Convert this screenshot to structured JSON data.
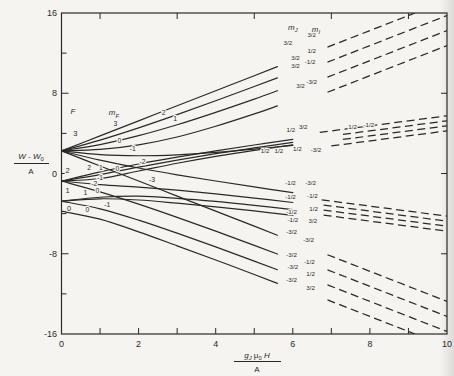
{
  "page": {
    "paper": "#f5f4f0",
    "ink": "#2a2927"
  },
  "chart_data": {
    "type": "line",
    "title": "",
    "x_axis": {
      "min": 0,
      "max": 10,
      "tick_step": 1,
      "labels": [
        0,
        2,
        4,
        6,
        8,
        10
      ],
      "top_ticks": [
        1,
        3,
        5,
        7,
        9
      ],
      "title": {
        "numerator": [
          {
            "t": "g",
            "italic": true
          },
          {
            "t": "J",
            "sub": true,
            "italic": true
          },
          {
            "t": " μ"
          },
          {
            "t": "0",
            "sub": true
          },
          {
            "t": " H",
            "italic": true
          }
        ],
        "denominator": "A"
      }
    },
    "y_axis": {
      "min": -16,
      "max": 16,
      "tick_step": 4,
      "labels": [
        16,
        8,
        0,
        -8,
        -16
      ],
      "right_ticks": [
        -8,
        0,
        8
      ],
      "title": {
        "numerator": [
          {
            "t": "W - W",
            "italic": true
          },
          {
            "t": "0",
            "sub": true
          }
        ],
        "denominator": "A"
      }
    },
    "column_headers": {
      "F": {
        "parts": [
          {
            "t": "F",
            "italic": true
          }
        ],
        "x": 0.3,
        "e": 6.15
      },
      "mF": {
        "parts": [
          {
            "t": "m",
            "italic": true
          },
          {
            "t": "F",
            "sub": true,
            "italic": true
          }
        ],
        "x": 1.36,
        "e": 6.05
      },
      "mJ": {
        "parts": [
          {
            "t": "m",
            "italic": true
          },
          {
            "t": "J",
            "sub": true,
            "italic": true
          }
        ],
        "x": 6.0,
        "e": 14.55
      },
      "mI": {
        "parts": [
          {
            "t": "m",
            "italic": true
          },
          {
            "t": "I",
            "sub": true,
            "italic": true
          }
        ],
        "x": 6.6,
        "e": 14.35
      }
    },
    "f_labels": [
      {
        "t": "3",
        "x": 0.36,
        "e": 3.95
      },
      {
        "t": "2",
        "x": 0.16,
        "e": 0.3
      },
      {
        "t": "1",
        "x": 0.16,
        "e": -1.65
      },
      {
        "t": "0",
        "x": 0.2,
        "e": -3.45
      }
    ],
    "series": [
      {
        "f": 3,
        "mf": "3",
        "mj": "3/2",
        "mi": "3/2",
        "solid": [
          [
            0,
            2.25
          ],
          [
            1,
            3.75
          ],
          [
            2,
            5.25
          ],
          [
            3,
            6.75
          ],
          [
            4,
            8.25
          ],
          [
            5,
            9.75
          ],
          [
            5.6,
            10.65
          ]
        ],
        "dashed": [
          [
            6.9,
            12.6
          ],
          [
            9.17,
            16.0
          ]
        ],
        "mf_at": 1.4,
        "mj_at": [
          5.87,
          13.0
        ],
        "mi_at": [
          6.49,
          13.8
        ]
      },
      {
        "f": 3,
        "mf": "2",
        "mj": "3/2",
        "mi": "1/2",
        "solid": [
          [
            0,
            2.25
          ],
          [
            1,
            3.33
          ],
          [
            2,
            4.55
          ],
          [
            3,
            5.87
          ],
          [
            4,
            7.25
          ],
          [
            5,
            8.67
          ],
          [
            5.6,
            9.53
          ]
        ],
        "dashed": [
          [
            6.9,
            11.1
          ],
          [
            10,
            15.75
          ]
        ],
        "mf_at": 2.65,
        "mj_at": [
          6.07,
          11.55
        ],
        "mi_at": [
          6.49,
          12.2
        ]
      },
      {
        "f": 3,
        "mf": "1",
        "mj": "3/2",
        "mi": "-1/2",
        "solid": [
          [
            0,
            2.25
          ],
          [
            1,
            2.88
          ],
          [
            2,
            3.77
          ],
          [
            3,
            4.86
          ],
          [
            4,
            6.1
          ],
          [
            5,
            7.42
          ],
          [
            5.6,
            8.25
          ]
        ],
        "dashed": [
          [
            6.9,
            9.6
          ],
          [
            10,
            14.25
          ]
        ],
        "mf_at": 2.95,
        "mj_at": [
          6.07,
          10.7
        ],
        "mi_at": [
          6.45,
          11.15
        ]
      },
      {
        "f": 3,
        "mf": "0",
        "mj": "3/2",
        "mi": "-3/2",
        "solid": [
          [
            0,
            2.25
          ],
          [
            1,
            2.4
          ],
          [
            2,
            2.86
          ],
          [
            3,
            3.64
          ],
          [
            4,
            4.71
          ],
          [
            5,
            5.94
          ],
          [
            5.6,
            6.74
          ]
        ],
        "dashed": [
          [
            6.9,
            8.1
          ],
          [
            10,
            12.75
          ]
        ],
        "mf_at": 1.5,
        "mj_at": [
          6.2,
          8.7
        ],
        "mi_at": [
          6.49,
          9.1
        ]
      },
      {
        "f": 3,
        "mf": "-1",
        "mj": "1/2",
        "mi": "-3/2",
        "solid": [
          [
            0,
            2.25
          ],
          [
            1,
            1.88
          ],
          [
            2,
            1.77
          ],
          [
            3,
            1.86
          ],
          [
            4,
            2.1
          ],
          [
            5,
            2.43
          ],
          [
            6,
            2.81
          ]
        ],
        "dashed": [
          [
            7.0,
            2.75
          ],
          [
            10,
            4.25
          ]
        ],
        "mf_at": 1.85,
        "mj_at": [
          6.12,
          2.4
        ],
        "mi_at": [
          6.6,
          2.3
        ]
      },
      {
        "f": 3,
        "mf": "-2",
        "mj": "-1/2",
        "mi": "-3/2",
        "solid": [
          [
            0,
            2.25
          ],
          [
            1,
            1.33
          ],
          [
            2,
            0.55
          ],
          [
            3,
            -0.13
          ],
          [
            4,
            -0.75
          ],
          [
            5,
            -1.34
          ],
          [
            6,
            -1.9
          ]
        ],
        "dashed": [
          [
            6.75,
            -2.63
          ],
          [
            10,
            -4.25
          ]
        ],
        "mf_at": 2.1,
        "mj_at": [
          5.94,
          -0.9
        ],
        "mi_at": [
          6.46,
          -0.9
        ]
      },
      {
        "f": 3,
        "mf": "-3",
        "mj": "-3/2",
        "mi": "-3/2",
        "solid": [
          [
            0,
            2.25
          ],
          [
            1,
            0.75
          ],
          [
            2,
            -0.75
          ],
          [
            3,
            -2.25
          ],
          [
            4,
            -3.75
          ],
          [
            5,
            -5.25
          ],
          [
            5.6,
            -6.15
          ]
        ],
        "dashed": [
          [
            6.9,
            -8.1
          ],
          [
            10,
            -12.75
          ]
        ],
        "mf_at": 2.35,
        "mj_at": [
          5.97,
          -5.85
        ],
        "mi_at": [
          6.41,
          -6.6
        ]
      },
      {
        "f": 2,
        "mf": "2",
        "mj": "1/2",
        "mi": "3/2",
        "solid": [
          [
            0,
            -0.75
          ],
          [
            1,
            0.17
          ],
          [
            2,
            0.95
          ],
          [
            3,
            1.63
          ],
          [
            4,
            2.25
          ],
          [
            5,
            2.84
          ],
          [
            6,
            3.4
          ]
        ],
        "dashed": [
          [
            6.7,
            4.1
          ],
          [
            10,
            5.75
          ]
        ],
        "mf_at": 0.72,
        "mj_at": [
          5.95,
          4.3
        ],
        "mi_at": [
          6.27,
          4.6
        ]
      },
      {
        "f": 2,
        "mf": "1",
        "mj": "1/2",
        "mi": "1/2",
        "solid": [
          [
            0,
            -0.75
          ],
          [
            1,
            -0.11
          ],
          [
            2,
            0.64
          ],
          [
            3,
            1.34
          ],
          [
            4,
            1.98
          ],
          [
            5,
            2.55
          ],
          [
            6,
            3.1
          ]
        ],
        "dashed": [
          [
            7.3,
            3.9
          ],
          [
            10,
            5.25
          ]
        ],
        "mf_at": 1.02,
        "mj_at": [
          5.28,
          2.25
        ],
        "mi_at": [
          5.64,
          2.25
        ]
      },
      {
        "f": 2,
        "mf": "0",
        "mj": "1/2",
        "mi": "-1/2",
        "solid": [
          [
            0,
            -0.75
          ],
          [
            1,
            -0.5
          ],
          [
            2,
            0.25
          ],
          [
            3,
            1.02
          ],
          [
            4,
            1.71
          ],
          [
            5,
            2.31
          ],
          [
            6,
            2.85
          ]
        ],
        "dashed": [
          [
            7.3,
            3.4
          ],
          [
            10,
            4.75
          ]
        ],
        "mf_at": 1.45,
        "mj_at": [
          7.55,
          4.6
        ],
        "mi_at": [
          7.97,
          4.8
        ]
      },
      {
        "f": 2,
        "mf": "-1",
        "mj": "-1/2",
        "mi": "-1/2",
        "solid": [
          [
            0,
            -0.75
          ],
          [
            1,
            -1.11
          ],
          [
            2,
            -1.36
          ],
          [
            3,
            -1.66
          ],
          [
            4,
            -2.03
          ],
          [
            5,
            -2.45
          ],
          [
            6,
            -2.89
          ]
        ],
        "dashed": [
          [
            6.8,
            -3.15
          ],
          [
            10,
            -4.75
          ]
        ],
        "mf_at": 1.0,
        "mj_at": [
          5.94,
          -2.35
        ],
        "mi_at": [
          6.51,
          -2.25
        ]
      },
      {
        "f": 2,
        "mf": "-2",
        "mj": "-3/2",
        "mi": "-1/2",
        "solid": [
          [
            0,
            -0.75
          ],
          [
            1,
            -1.83
          ],
          [
            2,
            -3.05
          ],
          [
            3,
            -4.37
          ],
          [
            4,
            -5.75
          ],
          [
            5,
            -7.17
          ],
          [
            5.6,
            -8.03
          ]
        ],
        "dashed": [
          [
            6.9,
            -9.6
          ],
          [
            10,
            -14.25
          ]
        ],
        "mf_at": 0.85,
        "mj_at": [
          5.97,
          -8.15
        ],
        "mi_at": [
          6.43,
          -8.85
        ]
      },
      {
        "f": 1,
        "mf": "1",
        "mj": "-1/2",
        "mi": "3/2",
        "solid": [
          [
            0,
            -2.75
          ],
          [
            1,
            -2.52
          ],
          [
            2,
            -2.64
          ],
          [
            3,
            -2.96
          ],
          [
            4,
            -3.32
          ],
          [
            5,
            -3.73
          ],
          [
            6,
            -4.17
          ]
        ],
        "dashed": [
          [
            6.8,
            -4.15
          ],
          [
            10,
            -5.75
          ]
        ],
        "mf_at": 0.62,
        "mj_at": [
          6.0,
          -4.65
        ],
        "mi_at": [
          6.52,
          -4.78
        ]
      },
      {
        "f": 1,
        "mf": "0",
        "mj": "-1/2",
        "mi": "1/2",
        "solid": [
          [
            0,
            -2.75
          ],
          [
            1,
            -2.37
          ],
          [
            2,
            -2.26
          ],
          [
            3,
            -2.47
          ],
          [
            4,
            -2.78
          ],
          [
            5,
            -3.17
          ],
          [
            6,
            -3.61
          ]
        ],
        "dashed": [
          [
            6.8,
            -3.65
          ],
          [
            10,
            -5.25
          ]
        ],
        "mf_at": 0.93,
        "mj_at": [
          5.97,
          -3.82
        ],
        "mi_at": [
          6.54,
          -3.55
        ]
      },
      {
        "f": 1,
        "mf": "-1",
        "mj": "-3/2",
        "mi": "1/2",
        "solid": [
          [
            0,
            -2.75
          ],
          [
            1,
            -3.52
          ],
          [
            2,
            -4.65
          ],
          [
            3,
            -5.95
          ],
          [
            4,
            -7.32
          ],
          [
            5,
            -8.73
          ],
          [
            5.6,
            -9.59
          ]
        ],
        "dashed": [
          [
            6.9,
            -11.1
          ],
          [
            10,
            -15.75
          ]
        ],
        "mf_at": 1.19,
        "mj_at": [
          6.0,
          -9.35
        ],
        "mi_at": [
          6.46,
          -10.05
        ]
      },
      {
        "f": 0,
        "mf": "0",
        "mj": "-3/2",
        "mi": "3/2",
        "solid": [
          [
            0,
            -3.75
          ],
          [
            1,
            -4.55
          ],
          [
            2,
            -5.82
          ],
          [
            3,
            -7.21
          ],
          [
            4,
            -8.62
          ],
          [
            5,
            -10.07
          ],
          [
            5.6,
            -10.95
          ]
        ],
        "dashed": [
          [
            6.9,
            -12.6
          ],
          [
            9.17,
            -16.0
          ]
        ],
        "mf_at": 0.67,
        "mj_at": [
          5.97,
          -10.65
        ],
        "mi_at": [
          6.46,
          -11.45
        ]
      }
    ],
    "layout": {
      "plot": {
        "left": 61.5,
        "right": 447,
        "top": 13,
        "bottom": 334
      },
      "grid": false,
      "dash_pattern": [
        8,
        4.5
      ]
    }
  }
}
